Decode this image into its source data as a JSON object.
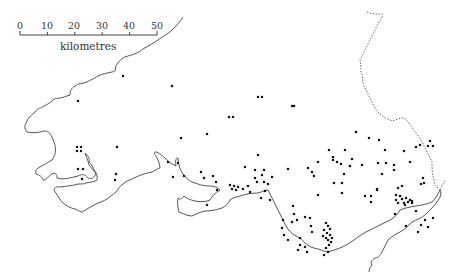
{
  "scale_bar": {
    "ticks": [
      "0",
      "10",
      "20",
      "30",
      "40",
      "50"
    ],
    "unit": "kilometres"
  },
  "colors": {
    "coastline": "#555555",
    "border": "#666666",
    "dot": "#111111"
  },
  "sites": [
    [
      123,
      76
    ],
    [
      78,
      101
    ],
    [
      172,
      86
    ],
    [
      262,
      97
    ],
    [
      258,
      97
    ],
    [
      229,
      117
    ],
    [
      233,
      117
    ],
    [
      292,
      106
    ],
    [
      294,
      106
    ],
    [
      181,
      138
    ],
    [
      207,
      134
    ],
    [
      77,
      147
    ],
    [
      81,
      147
    ],
    [
      77,
      151
    ],
    [
      81,
      151
    ],
    [
      117,
      147
    ],
    [
      78,
      169
    ],
    [
      83,
      169
    ],
    [
      82,
      179
    ],
    [
      116,
      174
    ],
    [
      115,
      180
    ],
    [
      178,
      163
    ],
    [
      168,
      162
    ],
    [
      184,
      176
    ],
    [
      173,
      177
    ],
    [
      201,
      172
    ],
    [
      204,
      178
    ],
    [
      216,
      182
    ],
    [
      213,
      176
    ],
    [
      217,
      190
    ],
    [
      230,
      185
    ],
    [
      207,
      205
    ],
    [
      258,
      155
    ],
    [
      255,
      170
    ],
    [
      264,
      170
    ],
    [
      245,
      167
    ],
    [
      255,
      178
    ],
    [
      257,
      182
    ],
    [
      262,
      175
    ],
    [
      264,
      182
    ],
    [
      268,
      184
    ],
    [
      272,
      177
    ],
    [
      265,
      191
    ],
    [
      261,
      198
    ],
    [
      270,
      200
    ],
    [
      288,
      169
    ],
    [
      293,
      206
    ],
    [
      234,
      186
    ],
    [
      236,
      190
    ],
    [
      238,
      187
    ],
    [
      232,
      189
    ],
    [
      243,
      189
    ],
    [
      248,
      186
    ],
    [
      250,
      192
    ],
    [
      356,
      132
    ],
    [
      369,
      138
    ],
    [
      379,
      140
    ],
    [
      385,
      150
    ],
    [
      345,
      150
    ],
    [
      352,
      159
    ],
    [
      350,
      166
    ],
    [
      378,
      163
    ],
    [
      386,
      163
    ],
    [
      394,
      165
    ],
    [
      404,
      151
    ],
    [
      416,
      147
    ],
    [
      420,
      145
    ],
    [
      308,
      168
    ],
    [
      312,
      172
    ],
    [
      318,
      162
    ],
    [
      329,
      150
    ],
    [
      333,
      157
    ],
    [
      333,
      160
    ],
    [
      337,
      162
    ],
    [
      341,
      164
    ],
    [
      344,
      174
    ],
    [
      314,
      176
    ],
    [
      334,
      183
    ],
    [
      342,
      183
    ],
    [
      362,
      165
    ],
    [
      377,
      190
    ],
    [
      342,
      193
    ],
    [
      318,
      195
    ],
    [
      394,
      170
    ],
    [
      382,
      174
    ],
    [
      365,
      196
    ],
    [
      371,
      202
    ],
    [
      377,
      189
    ],
    [
      371,
      196
    ],
    [
      398,
      188
    ],
    [
      402,
      186
    ],
    [
      396,
      195
    ],
    [
      400,
      196
    ],
    [
      396,
      200
    ],
    [
      398,
      203
    ],
    [
      402,
      199
    ],
    [
      404,
      203
    ],
    [
      406,
      198
    ],
    [
      405,
      205
    ],
    [
      408,
      202
    ],
    [
      410,
      200
    ],
    [
      412,
      203
    ],
    [
      297,
      220
    ],
    [
      305,
      217
    ],
    [
      310,
      218
    ],
    [
      311,
      226
    ],
    [
      300,
      238
    ],
    [
      312,
      232
    ],
    [
      284,
      235
    ],
    [
      288,
      240
    ],
    [
      294,
      214
    ],
    [
      282,
      228
    ],
    [
      292,
      222
    ],
    [
      283,
      220
    ],
    [
      300,
      245
    ],
    [
      298,
      250
    ],
    [
      305,
      247
    ],
    [
      307,
      252
    ],
    [
      326,
      223
    ],
    [
      328,
      226
    ],
    [
      330,
      229
    ],
    [
      324,
      230
    ],
    [
      327,
      233
    ],
    [
      330,
      235
    ],
    [
      332,
      238
    ],
    [
      326,
      238
    ],
    [
      328,
      240
    ],
    [
      323,
      236
    ],
    [
      331,
      242
    ],
    [
      329,
      245
    ],
    [
      326,
      248
    ],
    [
      328,
      252
    ],
    [
      324,
      255
    ],
    [
      430,
      141
    ],
    [
      428,
      146
    ],
    [
      433,
      146
    ],
    [
      410,
      162
    ],
    [
      423,
      178
    ],
    [
      424,
      183
    ],
    [
      421,
      184
    ],
    [
      412,
      201
    ],
    [
      416,
      211
    ],
    [
      425,
      220
    ],
    [
      428,
      227
    ],
    [
      421,
      225
    ],
    [
      418,
      232
    ],
    [
      406,
      226
    ],
    [
      433,
      218
    ],
    [
      395,
      214
    ]
  ]
}
